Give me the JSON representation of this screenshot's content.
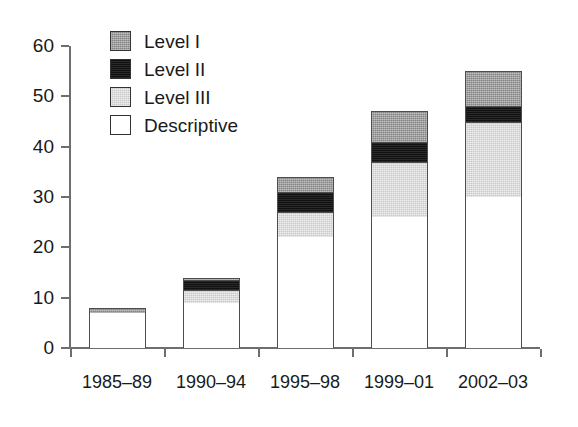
{
  "chart_data": {
    "type": "bar",
    "subtype": "stacked-bar",
    "title": "",
    "xlabel": "",
    "ylabel": "",
    "categories": [
      "1985–89",
      "1990–94",
      "1995–98",
      "1999–01",
      "2002–03"
    ],
    "series": [
      {
        "name": "Descriptive",
        "color": "#ffffff",
        "values": [
          7,
          9,
          22,
          26,
          30
        ]
      },
      {
        "name": "Level III",
        "color": "#c9c9c9",
        "values": [
          0,
          2.5,
          5,
          11,
          15
        ]
      },
      {
        "name": "Level II",
        "color": "#111111",
        "values": [
          0,
          2,
          4,
          4,
          3
        ]
      },
      {
        "name": "Level I",
        "color": "#848484",
        "values": [
          1,
          0.5,
          3,
          6,
          7
        ]
      }
    ],
    "totals": [
      8,
      14,
      34,
      47,
      55
    ],
    "ylim": [
      0,
      60
    ],
    "yticks": [
      0,
      10,
      20,
      30,
      40,
      50,
      60
    ],
    "ytick_labels": [
      "0",
      "10",
      "20",
      "30",
      "40",
      "50",
      "60"
    ],
    "grid": false,
    "legend_position": "top-left",
    "legend": [
      {
        "label": "Level I",
        "swatch": "dark-gray-hatched"
      },
      {
        "label": "Level II",
        "swatch": "black"
      },
      {
        "label": "Level III",
        "swatch": "light-gray-hatched"
      },
      {
        "label": "Descriptive",
        "swatch": "white"
      }
    ]
  },
  "axis": {
    "line_color": "#6e6e6e",
    "text_color": "#1a1a1a"
  }
}
